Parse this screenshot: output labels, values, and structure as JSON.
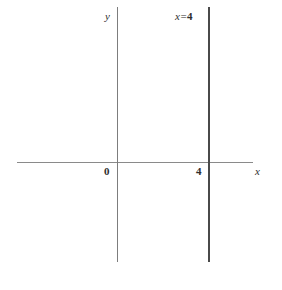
{
  "figure": {
    "kind": "cartesian-plane-diagram",
    "width": 282,
    "height": 290,
    "background_color": "#ffffff"
  },
  "labels": {
    "y_axis": "y",
    "x_axis": "x",
    "origin": "0",
    "x_intercept": "4",
    "equation_variable": "x",
    "equation_operator": "=",
    "equation_value": "4",
    "equation_full": "x = 4"
  },
  "colors": {
    "x_axis_stroke": "#8a8a8a",
    "y_axis_stroke": "#7d7d7d",
    "graph_line_stroke": "#4a4a4a",
    "text": "#2e2e2e"
  },
  "chart_data": {
    "type": "line",
    "title": "",
    "subtitle": "",
    "xlabel": "x",
    "ylabel": "y",
    "grid": false,
    "legend": "none",
    "annotations": [
      {
        "text": "x = 4",
        "x": 4,
        "y": 10.5,
        "position": "above-line"
      }
    ],
    "xticks": [
      0,
      4
    ],
    "xticklabels": [
      "0",
      "4"
    ],
    "yticks": [],
    "yticklabels": [],
    "xlim": [
      -4.3,
      6.1
    ],
    "ylim": [
      -4.3,
      6.9
    ],
    "series": [
      {
        "name": "x = 4",
        "kind": "vertical-line",
        "equation": "x = 4",
        "x_constant": 4,
        "points": [
          {
            "x": 4,
            "y": 6.9
          },
          {
            "x": 4,
            "y": -4.3
          }
        ]
      }
    ]
  }
}
